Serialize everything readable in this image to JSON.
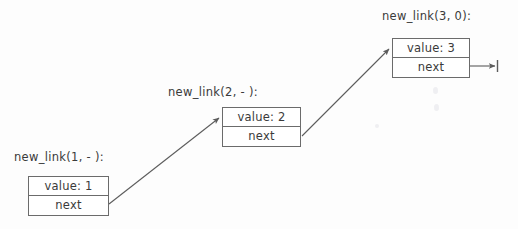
{
  "diagram": {
    "background_color": "#fdfdfd",
    "stroke_color": "#6b6b6b",
    "text_color": "#3a3a3a",
    "nodes": [
      {
        "id": "node1",
        "caption": "new_link(1, - ):",
        "value_label": "value: 1",
        "next_label": "next",
        "x": 28,
        "y": 176,
        "width": 81,
        "caption_x": 14,
        "caption_y": 150
      },
      {
        "id": "node2",
        "caption": "new_link(2, - ):",
        "value_label": "value: 2",
        "next_label": "next",
        "x": 222,
        "y": 107,
        "width": 79,
        "caption_x": 168,
        "caption_y": 85
      },
      {
        "id": "node3",
        "caption": "new_link(3, 0):",
        "value_label": "value: 3",
        "next_label": "next",
        "x": 392,
        "y": 38,
        "width": 78,
        "caption_x": 382,
        "caption_y": 9
      }
    ],
    "links": [
      {
        "id": "link-1-to-2",
        "from": "node1",
        "to": "node2",
        "x1": 109,
        "y1": 204,
        "x2": 219,
        "y2": 118
      },
      {
        "id": "link-2-to-3",
        "from": "node2",
        "to": "node3",
        "x1": 302,
        "y1": 136,
        "x2": 389,
        "y2": 49
      },
      {
        "id": "link-3-to-null",
        "from": "node3",
        "to": "null-terminator",
        "x1": 470,
        "y1": 66,
        "x2": 497,
        "y2": 66
      }
    ],
    "terminator": {
      "id": "null-terminator",
      "x": 497,
      "y_top": 60,
      "y_bottom": 72
    }
  }
}
